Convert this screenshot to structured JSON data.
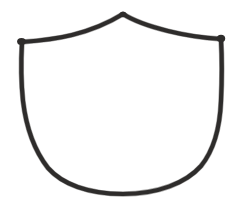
{
  "artwork": {
    "title": "Hand-drawn shield outline",
    "subject": "shield",
    "style": "hand-drawn ink sketch",
    "fill": "none",
    "background_color": "#ffffff",
    "stroke_color": "#2e2c2b",
    "stroke_color_secondary": "#3a3836",
    "stroke_width": 4.2,
    "canvas": {
      "width": 232,
      "height": 204
    },
    "key_points": {
      "apex": {
        "x": 123,
        "y": 13
      },
      "left_shoulder": {
        "x": 21,
        "y": 42
      },
      "right_shoulder": {
        "x": 221,
        "y": 38
      },
      "bottom_tip": {
        "x": 123,
        "y": 193
      }
    },
    "outline_path": "M 123 14 C 110 22 92 30 72 35 C 56 39 36 41 22 42 C 21 60 21 82 23 101 C 26 126 34 150 48 168 C 62 184 88 194 123 194 C 158 194 186 183 201 166 C 214 150 220 126 221 101 C 222 80 222 57 221 39 C 204 38 184 35 168 31 C 148 26 134 21 123 14 Z",
    "node_blobs": [
      {
        "x": 21.5,
        "y": 41.5,
        "rx": 4.4,
        "ry": 3.6
      },
      {
        "x": 221,
        "y": 38.5,
        "rx": 4.2,
        "ry": 3.8
      },
      {
        "x": 123,
        "y": 14.5,
        "rx": 3.6,
        "ry": 2.8
      }
    ]
  }
}
